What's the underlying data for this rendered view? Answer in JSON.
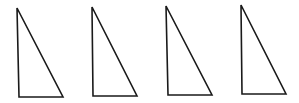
{
  "diagram": {
    "stroke_color": "#1a1a1a",
    "stroke_width": 1.6,
    "background": "#ffffff",
    "triangles": [
      {
        "id": 1,
        "points": [
          [
            17,
            8
          ],
          [
            19,
            97
          ],
          [
            63,
            97
          ]
        ]
      },
      {
        "id": 2,
        "points": [
          [
            92,
            7
          ],
          [
            93,
            96
          ],
          [
            137,
            96
          ]
        ]
      },
      {
        "id": 3,
        "points": [
          [
            166,
            6
          ],
          [
            168,
            95
          ],
          [
            212,
            95
          ]
        ]
      },
      {
        "id": 4,
        "points": [
          [
            241,
            5
          ],
          [
            242,
            94
          ],
          [
            286,
            94
          ]
        ]
      }
    ]
  }
}
